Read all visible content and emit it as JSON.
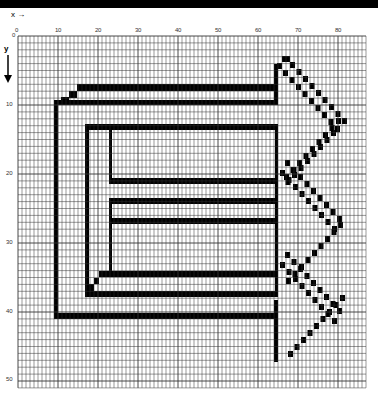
{
  "figure": {
    "x_axis_label": "x",
    "y_axis_label": "y",
    "x_ticks": [
      "0",
      "10",
      "20",
      "30",
      "40",
      "50",
      "60",
      "70",
      "80"
    ],
    "y_ticks": [
      "0",
      "10",
      "20",
      "30",
      "40",
      "50"
    ],
    "grid": {
      "columns": 87,
      "rows": 51,
      "line_color": "#333333",
      "fill_color": "#000000",
      "background": "#ffffff"
    }
  }
}
